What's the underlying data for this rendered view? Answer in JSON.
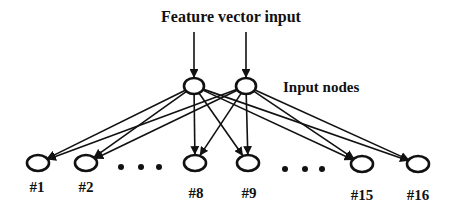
{
  "title": "Feature vector input",
  "input_label": "Input nodes",
  "colors": {
    "stroke": "#111111",
    "background": "#ffffff"
  },
  "input_nodes": [
    {
      "id": "in1",
      "x": 194,
      "y": 86
    },
    {
      "id": "in2",
      "x": 246,
      "y": 86
    }
  ],
  "output_nodes": [
    {
      "label": "#1",
      "x": 38,
      "y": 163,
      "lx": 37,
      "ly": 192
    },
    {
      "label": "#2",
      "x": 86,
      "y": 163,
      "lx": 86,
      "ly": 192
    },
    {
      "label": "#8",
      "x": 195,
      "y": 163,
      "lx": 196,
      "ly": 198
    },
    {
      "label": "#9",
      "x": 248,
      "y": 163,
      "lx": 249,
      "ly": 198
    },
    {
      "label": "#15",
      "x": 362,
      "y": 164,
      "lx": 362,
      "ly": 200
    },
    {
      "label": "#16",
      "x": 418,
      "y": 164,
      "lx": 418,
      "ly": 200
    }
  ],
  "ellipsis": [
    {
      "x": [
        121,
        141,
        159
      ],
      "y": 167
    },
    {
      "x": [
        285,
        305,
        322
      ],
      "y": 169
    }
  ]
}
